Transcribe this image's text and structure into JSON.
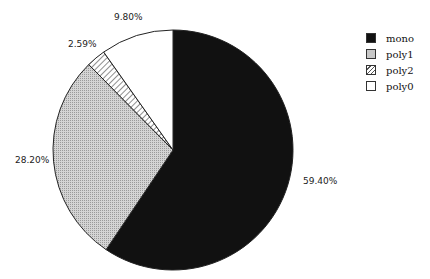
{
  "chart_data": {
    "type": "pie",
    "title": "",
    "categories": [
      "mono",
      "poly1",
      "poly2",
      "poly0"
    ],
    "values": [
      59.4,
      28.2,
      2.59,
      9.8
    ],
    "labels": [
      "59.40%",
      "28.20%",
      "2.59%",
      "9.80%"
    ],
    "fills": [
      "#111111",
      "#c8c8c8",
      "hatch",
      "#ffffff"
    ],
    "start_angle_deg": 90,
    "direction": "clockwise",
    "legend_position": "top-right"
  },
  "legend": [
    {
      "label": "mono"
    },
    {
      "label": "poly1"
    },
    {
      "label": "poly2"
    },
    {
      "label": "poly0"
    }
  ]
}
